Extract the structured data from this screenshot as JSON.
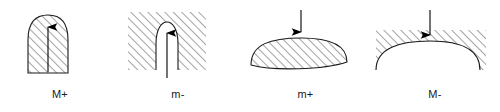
{
  "figure": {
    "type": "diagram",
    "background_color": "#ffffff",
    "line_color": "#1a1a1a",
    "hatch_color": "#555555",
    "panels": [
      {
        "id": "panel-0",
        "caption": "M+",
        "shape": "tall-convex-bullet",
        "hatched_region": "inside-shape",
        "arrow_direction": "up",
        "arrow_position": "center-interior",
        "arrow_tip_at": "apex"
      },
      {
        "id": "panel-1",
        "caption": "m-",
        "shape": "tall-concave-notch-in-block",
        "hatched_region": "outside-notch",
        "arrow_direction": "up",
        "arrow_position": "center-notch",
        "arrow_tip_at": "apex"
      },
      {
        "id": "panel-2",
        "caption": "m+",
        "shape": "wide-shallow-dome",
        "hatched_region": "inside-shape",
        "arrow_direction": "down",
        "arrow_position": "center-above",
        "arrow_tip_at": "apex"
      },
      {
        "id": "panel-3",
        "caption": "M-",
        "shape": "wide-shallow-dome-cut-from-block",
        "hatched_region": "outside-dome",
        "arrow_direction": "down",
        "arrow_position": "center-above",
        "arrow_tip_at": "apex"
      }
    ]
  }
}
